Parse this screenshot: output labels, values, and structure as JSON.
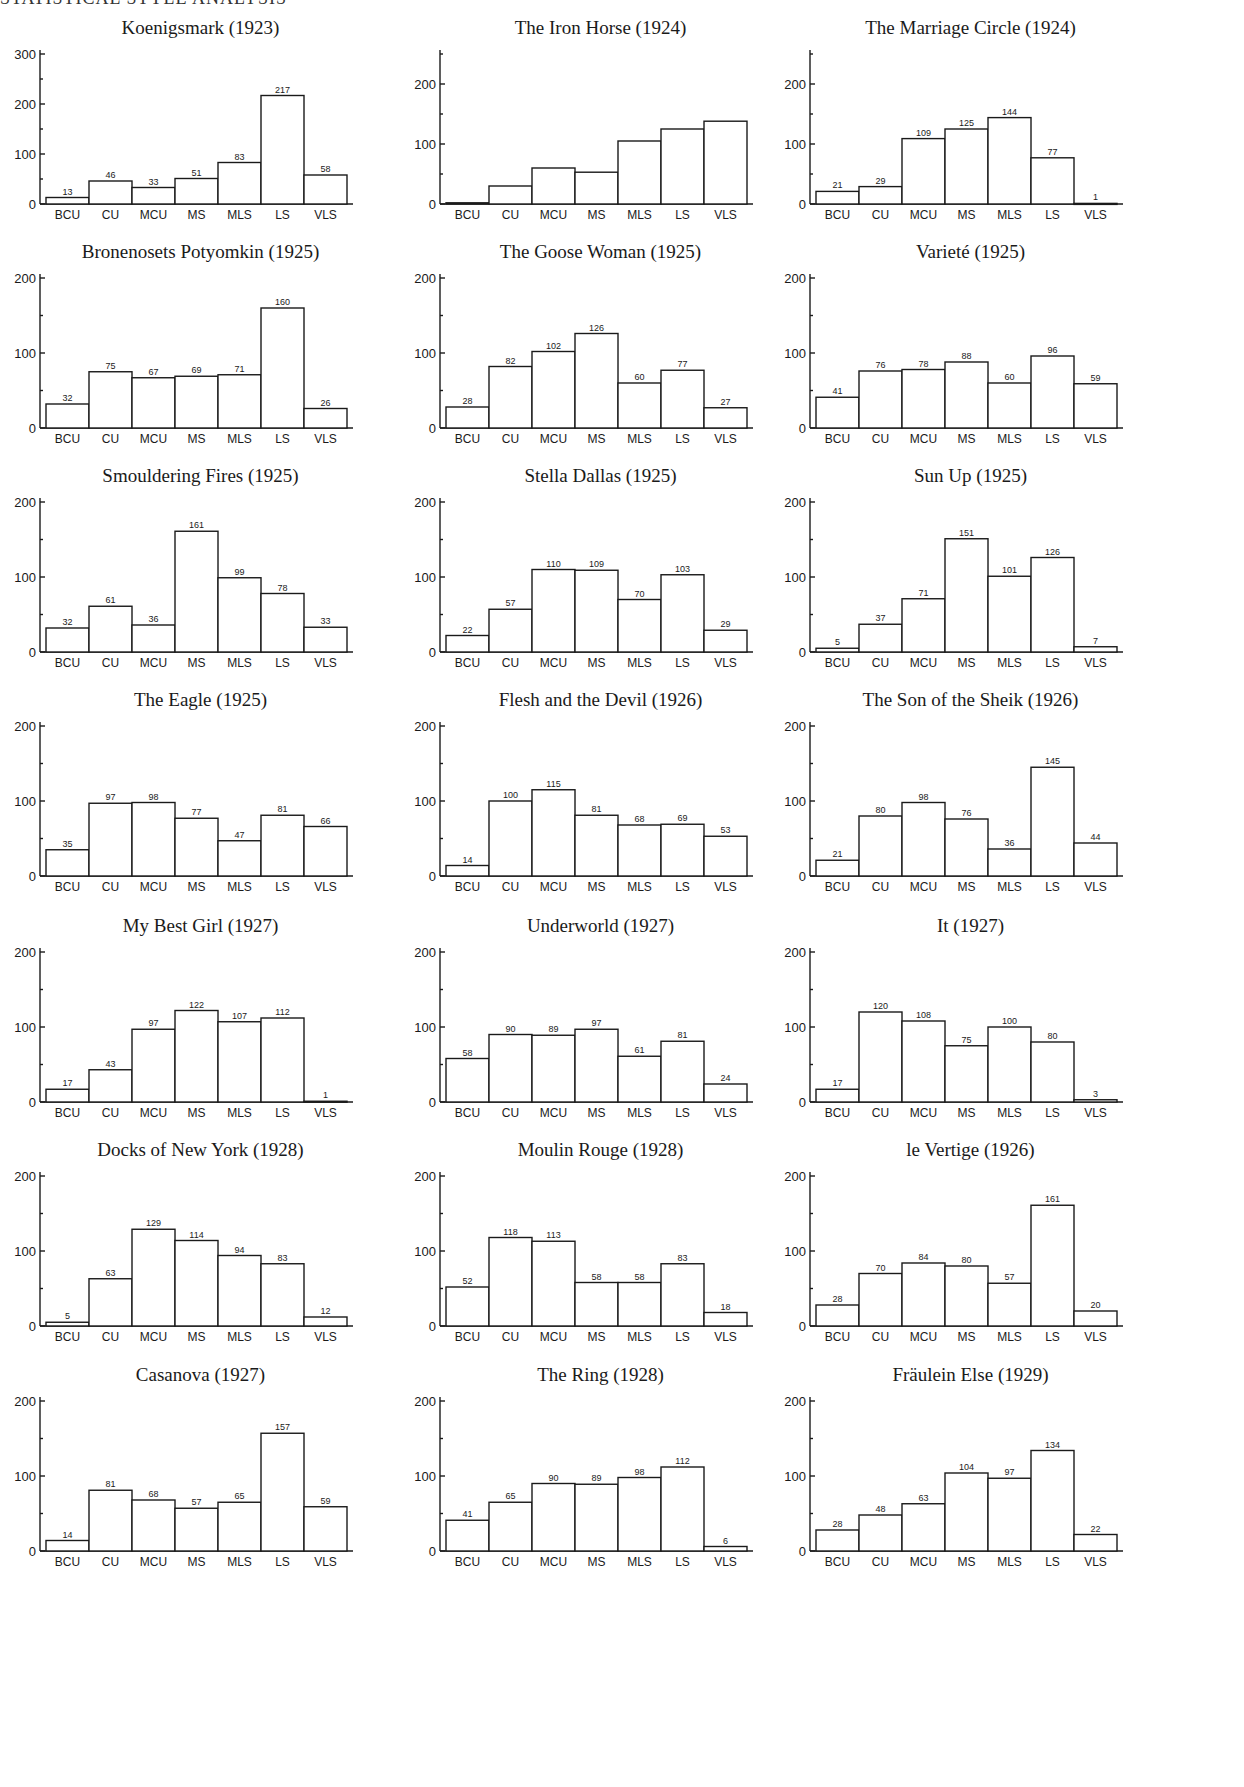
{
  "header": {
    "text": "STATISTICAL STYLE ANALYSIS"
  },
  "chart_data": [
    {
      "type": "bar",
      "title": "Koenigsmark (1923)",
      "categories": [
        "BCU",
        "CU",
        "MCU",
        "MS",
        "MLS",
        "LS",
        "VLS"
      ],
      "values": [
        13,
        46,
        33,
        51,
        83,
        217,
        58
      ],
      "labels_shown": true,
      "ylim": [
        0,
        300
      ],
      "yticks": [
        0,
        100,
        200,
        300
      ],
      "xlabel": "",
      "ylabel": ""
    },
    {
      "type": "bar",
      "title": "The Iron Horse (1924)",
      "categories": [
        "BCU",
        "CU",
        "MCU",
        "MS",
        "MLS",
        "LS",
        "VLS"
      ],
      "values": [
        2,
        30,
        60,
        53,
        105,
        125,
        138
      ],
      "labels_shown": false,
      "ylim": [
        0,
        250
      ],
      "yticks": [
        0,
        100,
        200
      ],
      "xlabel": "",
      "ylabel": ""
    },
    {
      "type": "bar",
      "title": "The Marriage Circle (1924)",
      "categories": [
        "BCU",
        "CU",
        "MCU",
        "MS",
        "MLS",
        "LS",
        "VLS"
      ],
      "values": [
        21,
        29,
        109,
        125,
        144,
        77,
        1
      ],
      "labels_shown": true,
      "ylim": [
        0,
        250
      ],
      "yticks": [
        0,
        100,
        200
      ],
      "xlabel": "",
      "ylabel": ""
    },
    {
      "type": "bar",
      "title": "Bronenosets Potyomkin (1925)",
      "categories": [
        "BCU",
        "CU",
        "MCU",
        "MS",
        "MLS",
        "LS",
        "VLS"
      ],
      "values": [
        32,
        75,
        67,
        69,
        71,
        160,
        26
      ],
      "labels_shown": true,
      "ylim": [
        0,
        200
      ],
      "yticks": [
        0,
        100,
        200
      ],
      "xlabel": "",
      "ylabel": ""
    },
    {
      "type": "bar",
      "title": "The Goose Woman (1925)",
      "categories": [
        "BCU",
        "CU",
        "MCU",
        "MS",
        "MLS",
        "LS",
        "VLS"
      ],
      "values": [
        28,
        82,
        102,
        126,
        60,
        77,
        27
      ],
      "labels_shown": true,
      "ylim": [
        0,
        200
      ],
      "yticks": [
        0,
        100,
        200
      ],
      "xlabel": "",
      "ylabel": ""
    },
    {
      "type": "bar",
      "title": "Varieté (1925)",
      "categories": [
        "BCU",
        "CU",
        "MCU",
        "MS",
        "MLS",
        "LS",
        "VLS"
      ],
      "values": [
        41,
        76,
        78,
        88,
        60,
        96,
        59
      ],
      "labels_shown": true,
      "ylim": [
        0,
        200
      ],
      "yticks": [
        0,
        100,
        200
      ],
      "xlabel": "",
      "ylabel": ""
    },
    {
      "type": "bar",
      "title": "Smouldering Fires (1925)",
      "categories": [
        "BCU",
        "CU",
        "MCU",
        "MS",
        "MLS",
        "LS",
        "VLS"
      ],
      "values": [
        32,
        61,
        36,
        161,
        99,
        78,
        33
      ],
      "labels_shown": true,
      "ylim": [
        0,
        200
      ],
      "yticks": [
        0,
        100,
        200
      ],
      "xlabel": "",
      "ylabel": ""
    },
    {
      "type": "bar",
      "title": "Stella Dallas (1925)",
      "categories": [
        "BCU",
        "CU",
        "MCU",
        "MS",
        "MLS",
        "LS",
        "VLS"
      ],
      "values": [
        22,
        57,
        110,
        109,
        70,
        103,
        29
      ],
      "labels_shown": true,
      "ylim": [
        0,
        200
      ],
      "yticks": [
        0,
        100,
        200
      ],
      "xlabel": "",
      "ylabel": ""
    },
    {
      "type": "bar",
      "title": "Sun Up (1925)",
      "categories": [
        "BCU",
        "CU",
        "MCU",
        "MS",
        "MLS",
        "LS",
        "VLS"
      ],
      "values": [
        5,
        37,
        71,
        151,
        101,
        126,
        7
      ],
      "labels_shown": true,
      "ylim": [
        0,
        200
      ],
      "yticks": [
        0,
        100,
        200
      ],
      "xlabel": "",
      "ylabel": ""
    },
    {
      "type": "bar",
      "title": "The Eagle (1925)",
      "categories": [
        "BCU",
        "CU",
        "MCU",
        "MS",
        "MLS",
        "LS",
        "VLS"
      ],
      "values": [
        35,
        97,
        98,
        77,
        47,
        81,
        66
      ],
      "labels_shown": true,
      "ylim": [
        0,
        200
      ],
      "yticks": [
        0,
        100,
        200
      ],
      "xlabel": "",
      "ylabel": ""
    },
    {
      "type": "bar",
      "title": "Flesh and the Devil (1926)",
      "categories": [
        "BCU",
        "CU",
        "MCU",
        "MS",
        "MLS",
        "LS",
        "VLS"
      ],
      "values": [
        14,
        100,
        115,
        81,
        68,
        69,
        53
      ],
      "labels_shown": true,
      "ylim": [
        0,
        200
      ],
      "yticks": [
        0,
        100,
        200
      ],
      "xlabel": "",
      "ylabel": ""
    },
    {
      "type": "bar",
      "title": "The Son of the Sheik (1926)",
      "categories": [
        "BCU",
        "CU",
        "MCU",
        "MS",
        "MLS",
        "LS",
        "VLS"
      ],
      "values": [
        21,
        80,
        98,
        76,
        36,
        145,
        44
      ],
      "labels_shown": true,
      "ylim": [
        0,
        200
      ],
      "yticks": [
        0,
        100,
        200
      ],
      "xlabel": "",
      "ylabel": ""
    },
    {
      "type": "bar",
      "title": "My Best Girl (1927)",
      "categories": [
        "BCU",
        "CU",
        "MCU",
        "MS",
        "MLS",
        "LS",
        "VLS"
      ],
      "values": [
        17,
        43,
        97,
        122,
        107,
        112,
        1
      ],
      "labels_shown": true,
      "ylim": [
        0,
        200
      ],
      "yticks": [
        0,
        100,
        200
      ],
      "xlabel": "",
      "ylabel": ""
    },
    {
      "type": "bar",
      "title": "Underworld (1927)",
      "categories": [
        "BCU",
        "CU",
        "MCU",
        "MS",
        "MLS",
        "LS",
        "VLS"
      ],
      "values": [
        58,
        90,
        89,
        97,
        61,
        81,
        24
      ],
      "labels_shown": true,
      "ylim": [
        0,
        200
      ],
      "yticks": [
        0,
        100,
        200
      ],
      "xlabel": "",
      "ylabel": ""
    },
    {
      "type": "bar",
      "title": "It (1927)",
      "categories": [
        "BCU",
        "CU",
        "MCU",
        "MS",
        "MLS",
        "LS",
        "VLS"
      ],
      "values": [
        17,
        120,
        108,
        75,
        100,
        80,
        3
      ],
      "labels_shown": true,
      "ylim": [
        0,
        200
      ],
      "yticks": [
        0,
        100,
        200
      ],
      "xlabel": "",
      "ylabel": ""
    },
    {
      "type": "bar",
      "title": "Docks of New York (1928)",
      "categories": [
        "BCU",
        "CU",
        "MCU",
        "MS",
        "MLS",
        "LS",
        "VLS"
      ],
      "values": [
        5,
        63,
        129,
        114,
        94,
        83,
        12
      ],
      "labels_shown": true,
      "ylim": [
        0,
        200
      ],
      "yticks": [
        0,
        100,
        200
      ],
      "xlabel": "",
      "ylabel": ""
    },
    {
      "type": "bar",
      "title": "Moulin Rouge (1928)",
      "categories": [
        "BCU",
        "CU",
        "MCU",
        "MS",
        "MLS",
        "LS",
        "VLS"
      ],
      "values": [
        52,
        118,
        113,
        58,
        58,
        83,
        18
      ],
      "labels_shown": true,
      "ylim": [
        0,
        200
      ],
      "yticks": [
        0,
        100,
        200
      ],
      "xlabel": "",
      "ylabel": ""
    },
    {
      "type": "bar",
      "title": "le Vertige (1926)",
      "categories": [
        "BCU",
        "CU",
        "MCU",
        "MS",
        "MLS",
        "LS",
        "VLS"
      ],
      "values": [
        28,
        70,
        84,
        80,
        57,
        161,
        20
      ],
      "labels_shown": true,
      "ylim": [
        0,
        200
      ],
      "yticks": [
        0,
        100,
        200
      ],
      "xlabel": "",
      "ylabel": ""
    },
    {
      "type": "bar",
      "title": "Casanova (1927)",
      "categories": [
        "BCU",
        "CU",
        "MCU",
        "MS",
        "MLS",
        "LS",
        "VLS"
      ],
      "values": [
        14,
        81,
        68,
        57,
        65,
        157,
        59
      ],
      "labels_shown": true,
      "ylim": [
        0,
        200
      ],
      "yticks": [
        0,
        100,
        200
      ],
      "xlabel": "",
      "ylabel": ""
    },
    {
      "type": "bar",
      "title": "The Ring (1928)",
      "categories": [
        "BCU",
        "CU",
        "MCU",
        "MS",
        "MLS",
        "LS",
        "VLS"
      ],
      "values": [
        41,
        65,
        90,
        89,
        98,
        112,
        6
      ],
      "labels_shown": true,
      "ylim": [
        0,
        200
      ],
      "yticks": [
        0,
        100,
        200
      ],
      "xlabel": "",
      "ylabel": ""
    },
    {
      "type": "bar",
      "title": "Fräulein Else (1929)",
      "categories": [
        "BCU",
        "CU",
        "MCU",
        "MS",
        "MLS",
        "LS",
        "VLS"
      ],
      "values": [
        28,
        48,
        63,
        104,
        97,
        134,
        22
      ],
      "labels_shown": true,
      "ylim": [
        0,
        200
      ],
      "yticks": [
        0,
        100,
        200
      ],
      "xlabel": "",
      "ylabel": ""
    }
  ]
}
